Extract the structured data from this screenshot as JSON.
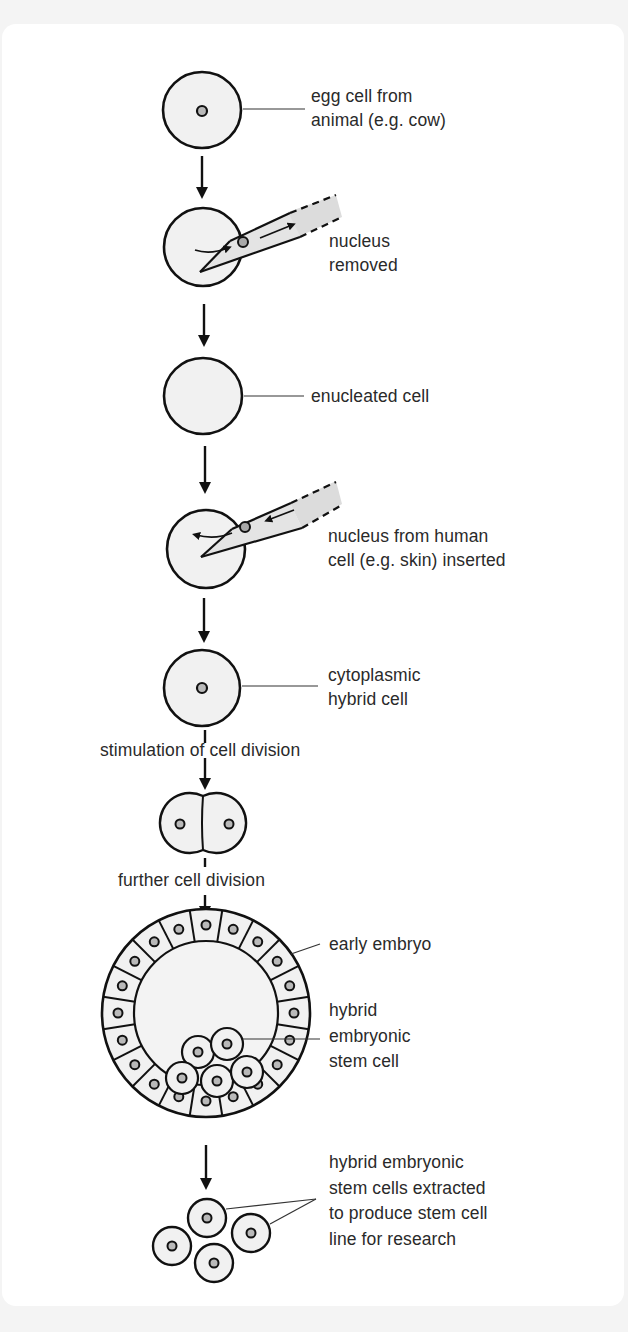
{
  "diagram": {
    "title_hidden": "",
    "steps": [
      {
        "id": "egg",
        "label": "egg cell from\nanimal (e.g. cow)"
      },
      {
        "id": "removed",
        "label": "nucleus\nremoved"
      },
      {
        "id": "enucleated",
        "label": "enucleated cell"
      },
      {
        "id": "inserted",
        "label": "nucleus from human\ncell (e.g. skin) inserted"
      },
      {
        "id": "hybrid",
        "label": "cytoplasmic\nhybrid cell"
      }
    ],
    "process_labels": {
      "stimulation": "stimulation of cell division",
      "further": "further cell division"
    },
    "embryo": {
      "early_embryo": "early embryo",
      "stem_cell": "hybrid\nembryonic\nstem cell"
    },
    "result_label": "hybrid embryonic\nstem cells extracted\nto produce stem cell\nline for research"
  },
  "colors": {
    "cell_fill": "#f1f1f1",
    "outline": "#111111",
    "nucleus_fill": "#b9b9b9",
    "pipette_fill": "#dedede",
    "leader_line": "#333333",
    "background": "#ffffff",
    "page_bg": "#f4f4f4"
  }
}
